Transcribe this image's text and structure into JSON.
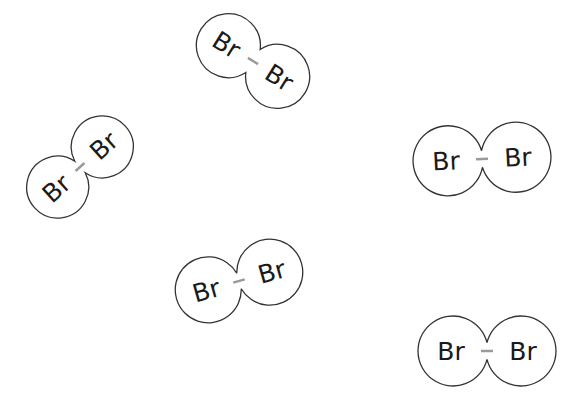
{
  "diagram": {
    "title": "",
    "molecules": [
      {
        "id": "m1",
        "atom1": "Br",
        "atom2": "Br",
        "bond": "single",
        "cx": 253,
        "cy": 61,
        "angle": 32,
        "sep": 58,
        "r": 32
      },
      {
        "id": "m2",
        "atom1": "Br",
        "atom2": "Br",
        "bond": "single",
        "cx": 80,
        "cy": 167,
        "angle": -42,
        "sep": 60,
        "r": 31
      },
      {
        "id": "m3",
        "atom1": "Br",
        "atom2": "Br",
        "bond": "single",
        "cx": 482,
        "cy": 159,
        "angle": -3,
        "sep": 68,
        "r": 35
      },
      {
        "id": "m4",
        "atom1": "Br",
        "atom2": "Br",
        "bond": "single",
        "cx": 239,
        "cy": 281,
        "angle": -16,
        "sep": 64,
        "r": 33
      },
      {
        "id": "m5",
        "atom1": "Br",
        "atom2": "Br",
        "bond": "single",
        "cx": 487,
        "cy": 351,
        "angle": 0,
        "sep": 68,
        "r": 35
      }
    ],
    "colors": {
      "outline": "#333333",
      "bond": "#9a9a9a",
      "text": "#1a1a1a",
      "background": "#ffffff"
    }
  }
}
